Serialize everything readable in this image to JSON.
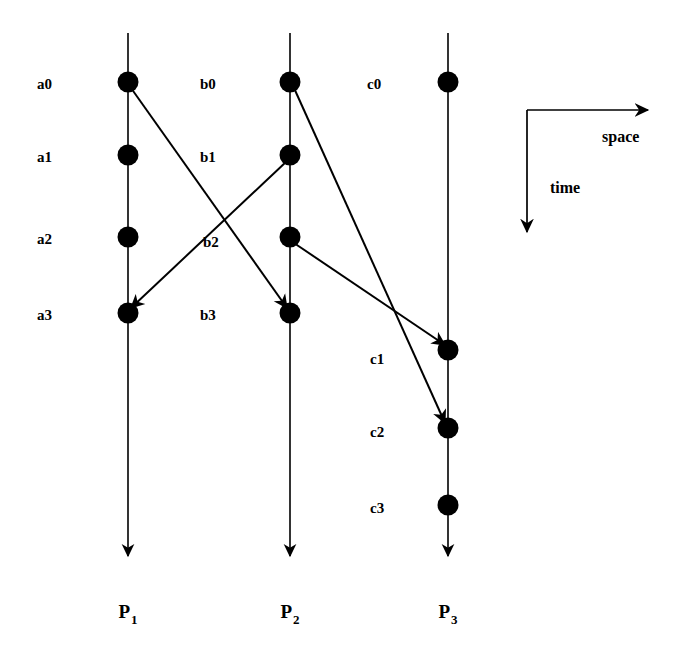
{
  "figure": {
    "background_color": "#ffffff",
    "ink_color": "#000000"
  },
  "chart_data": {
    "type": "diagram",
    "subtype": "space-time-process-diagram",
    "title": "",
    "xlabel": "space",
    "ylabel": "time",
    "grid": false,
    "legend": "none",
    "axes_key": {
      "space_label": "space",
      "time_label": "time",
      "space_direction": "right",
      "time_direction": "down",
      "corner_x": 527,
      "corner_y": 110,
      "space_arrow_end_x": 648,
      "time_arrow_end_y": 232
    },
    "processes": [
      {
        "id": "P1",
        "label": "P",
        "subscript": "1",
        "x": 128,
        "line_top_y": 33,
        "line_bottom_y": 556,
        "label_y": 618,
        "events": [
          {
            "name": "a0",
            "y": 82,
            "label_x": 37,
            "label_y": 89
          },
          {
            "name": "a1",
            "y": 155,
            "label_x": 37,
            "label_y": 162
          },
          {
            "name": "a2",
            "y": 237,
            "label_x": 37,
            "label_y": 244
          },
          {
            "name": "a3",
            "y": 313,
            "label_x": 37,
            "label_y": 320
          }
        ]
      },
      {
        "id": "P2",
        "label": "P",
        "subscript": "2",
        "x": 290,
        "line_top_y": 33,
        "line_bottom_y": 556,
        "label_y": 618,
        "events": [
          {
            "name": "b0",
            "y": 82,
            "label_x": 200,
            "label_y": 89
          },
          {
            "name": "b1",
            "y": 155,
            "label_x": 200,
            "label_y": 162
          },
          {
            "name": "b2",
            "y": 237,
            "label_x": 203,
            "label_y": 247
          },
          {
            "name": "b3",
            "y": 313,
            "label_x": 200,
            "label_y": 320
          }
        ]
      },
      {
        "id": "P3",
        "label": "P",
        "subscript": "3",
        "x": 448,
        "line_top_y": 33,
        "line_bottom_y": 556,
        "label_y": 618,
        "events": [
          {
            "name": "c0",
            "y": 82,
            "label_x": 367,
            "label_y": 89
          },
          {
            "name": "c1",
            "y": 350,
            "label_x": 370,
            "label_y": 364
          },
          {
            "name": "c2",
            "y": 428,
            "label_x": 370,
            "label_y": 437
          },
          {
            "name": "c3",
            "y": 505,
            "label_x": 370,
            "label_y": 513
          }
        ]
      }
    ],
    "messages": [
      {
        "from": "a0",
        "to": "b3",
        "x1": 131,
        "y1": 88,
        "x2": 287,
        "y2": 308
      },
      {
        "from": "b1",
        "to": "a3",
        "x1": 287,
        "y1": 161,
        "x2": 131,
        "y2": 308
      },
      {
        "from": "b0",
        "to": "c2",
        "x1": 294,
        "y1": 88,
        "x2": 445,
        "y2": 423
      },
      {
        "from": "b2",
        "to": "c1",
        "x1": 294,
        "y1": 243,
        "x2": 445,
        "y2": 345
      }
    ],
    "event_dot_radius": 10.5,
    "process_line_width": 1.6,
    "message_line_width": 2.0
  }
}
